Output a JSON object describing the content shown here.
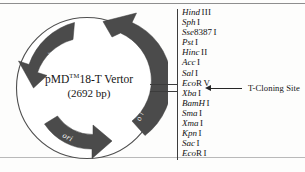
{
  "figure": {
    "kind": "plasmid-map",
    "background_color": "#fdfdfc",
    "line_color": "#3c3c3c",
    "arrow_fill_color": "#4b4b4b",
    "text_color": "#121212"
  },
  "plasmid": {
    "name_prefix": "pMD",
    "name_superscript": "TM",
    "name_suffix": "18-T Vertor",
    "size_label": "(2692 bp)",
    "genes": [
      {
        "label": "Amp",
        "superscript": "r",
        "position": "upper-left",
        "direction": "counterclockwise"
      },
      {
        "label": "lacZ",
        "position": "right",
        "direction": "counterclockwise"
      },
      {
        "label": "ori",
        "position": "bottom",
        "direction": "clockwise"
      }
    ]
  },
  "mcs": {
    "sites": [
      {
        "name": "Hind",
        "isoschizomer": "III"
      },
      {
        "name": "Sph",
        "isoschizomer": "I"
      },
      {
        "name": "Sse",
        "number": "8387",
        "isoschizomer": "I"
      },
      {
        "name": "Pst",
        "isoschizomer": "I"
      },
      {
        "name": "Hinc",
        "isoschizomer": "II"
      },
      {
        "name": "Acc",
        "isoschizomer": "I"
      },
      {
        "name": "Sal",
        "isoschizomer": "I"
      },
      {
        "name": "Eco",
        "number": "R",
        "isoschizomer": "V"
      },
      {
        "name": "Xba",
        "isoschizomer": "I"
      },
      {
        "name": "BamH",
        "isoschizomer": "I"
      },
      {
        "name": "Sma",
        "isoschizomer": "I"
      },
      {
        "name": "Xma",
        "isoschizomer": "I"
      },
      {
        "name": "Kpn",
        "isoschizomer": "I"
      },
      {
        "name": "Sac",
        "isoschizomer": "I"
      },
      {
        "name": "Eco",
        "number": "R",
        "isoschizomer": "I"
      }
    ]
  },
  "callout": {
    "label": "T-Cloning Site",
    "points_to": "EcoR V",
    "arrow_direction": "left"
  }
}
